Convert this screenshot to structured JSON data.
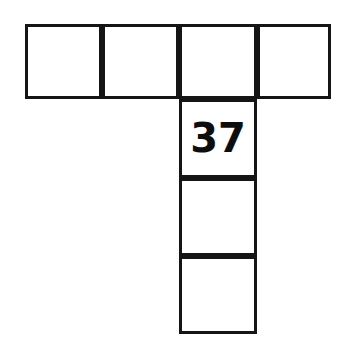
{
  "figure": {
    "name": "t-shaped-square-grid",
    "background_color": "#ffffff",
    "line_color": "#151515",
    "line_width_px": 3,
    "label_color": "#0d0d0d",
    "cells": [
      {
        "id": "top-row-cell-1",
        "label": "",
        "x": 25,
        "y": 24,
        "w": 77,
        "h": 75,
        "row": 1,
        "col": 1
      },
      {
        "id": "top-row-cell-2",
        "label": "",
        "x": 102,
        "y": 24,
        "w": 77,
        "h": 75,
        "row": 1,
        "col": 2
      },
      {
        "id": "top-row-cell-3",
        "label": "",
        "x": 179,
        "y": 24,
        "w": 78,
        "h": 75,
        "row": 1,
        "col": 3
      },
      {
        "id": "top-row-cell-4",
        "label": "",
        "x": 257,
        "y": 24,
        "w": 74,
        "h": 75,
        "row": 1,
        "col": 4
      },
      {
        "id": "stem-cell-1",
        "label": "37",
        "x": 179,
        "y": 99,
        "w": 78,
        "h": 79,
        "row": 2,
        "col": 3
      },
      {
        "id": "stem-cell-2",
        "label": "",
        "x": 179,
        "y": 178,
        "w": 78,
        "h": 78,
        "row": 3,
        "col": 3
      },
      {
        "id": "stem-cell-3",
        "label": "",
        "x": 179,
        "y": 256,
        "w": 78,
        "h": 78,
        "row": 4,
        "col": 3
      }
    ]
  },
  "chart_data": {
    "type": "table",
    "title": "",
    "xlabel": "",
    "ylabel": "",
    "shape": "T-tetromino-like net of 7 squares",
    "grid_rows": 4,
    "grid_cols": 4,
    "occupied_cells": [
      [
        1,
        1
      ],
      [
        1,
        2
      ],
      [
        1,
        3
      ],
      [
        1,
        4
      ],
      [
        2,
        3
      ],
      [
        3,
        3
      ],
      [
        4,
        3
      ]
    ],
    "labels": {
      "row2_col3": "37"
    },
    "values": [
      37
    ],
    "categories": [
      "row2_col3"
    ]
  }
}
